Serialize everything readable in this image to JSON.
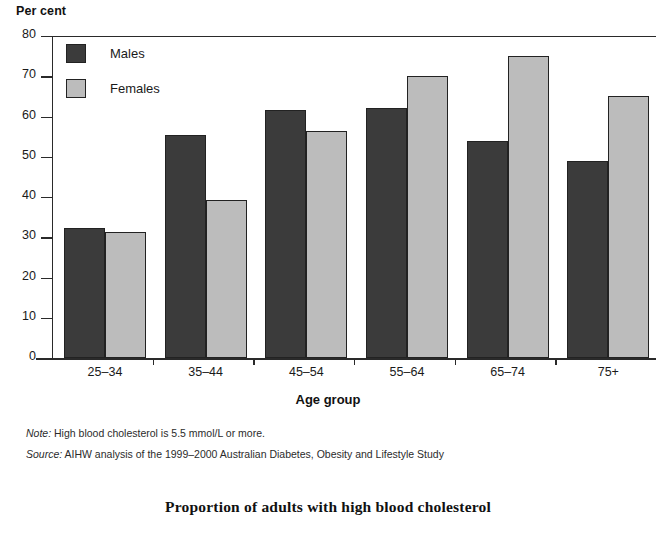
{
  "chart_data": {
    "type": "bar",
    "title": "Proportion of adults with high blood cholesterol",
    "xlabel": "Age group",
    "ylabel": "Per cent",
    "ylim": [
      0,
      80
    ],
    "yticks": [
      0,
      10,
      20,
      30,
      40,
      50,
      60,
      70,
      80
    ],
    "grid": false,
    "legend_position": "top-left",
    "categories": [
      "25–34",
      "35–44",
      "45–54",
      "55–64",
      "65–74",
      "75+"
    ],
    "series": [
      {
        "name": "Males",
        "color": "#3b3b3b",
        "values": [
          32.2,
          55.5,
          61.5,
          62.0,
          54.0,
          49.0
        ]
      },
      {
        "name": "Females",
        "color": "#bcbcbc",
        "values": [
          31.2,
          39.3,
          56.3,
          70.0,
          75.0,
          65.0
        ]
      }
    ],
    "annotations": [
      "Note: High blood cholesterol is 5.5 mmol/L or more.",
      "Source: AIHW analysis of the 1999–2000 Australian Diabetes, Obesity and Lifestyle Study"
    ]
  },
  "axis": {
    "y_title": "Per cent",
    "x_title": "Age group",
    "y_ticks": [
      "80",
      "70",
      "60",
      "50",
      "40",
      "30",
      "20",
      "10",
      "0"
    ],
    "x_ticks": [
      "25–34",
      "35–44",
      "45–54",
      "55–64",
      "65–74",
      "75+"
    ]
  },
  "legend": {
    "items": [
      {
        "label": "Males"
      },
      {
        "label": "Females"
      }
    ]
  },
  "notes": [
    {
      "prefix": "Note:",
      "text": " High blood cholesterol is 5.5 mmol/L or more."
    },
    {
      "prefix": "Source:",
      "text": " AIHW analysis of the 1999–2000 Australian Diabetes, Obesity and Lifestyle Study"
    }
  ],
  "caption": "Proportion of adults with high blood cholesterol"
}
